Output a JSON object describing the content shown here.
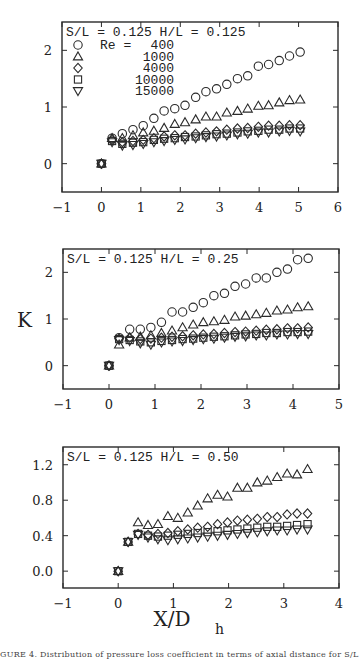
{
  "figure": {
    "y_axis_label": "K",
    "x_axis_label": "X/D",
    "x_axis_label_sub": "h",
    "caption": "GURE 4.  Distribution of pressure loss coefficient in terms of axial distance for S/L = 0"
  },
  "legend": {
    "title_prefix": "Re =",
    "entries": [
      {
        "label": "400",
        "marker": "circle"
      },
      {
        "label": "1000",
        "marker": "triangle-up"
      },
      {
        "label": "4000",
        "marker": "diamond"
      },
      {
        "label": "10000",
        "marker": "square"
      },
      {
        "label": "15000",
        "marker": "triangle-down"
      }
    ]
  },
  "chart_data": [
    {
      "type": "scatter",
      "title": "S/L = 0.125  H/L = 0.125",
      "xlabel": "",
      "ylabel": "",
      "xlim": [
        -1,
        6
      ],
      "ylim": [
        -0.5,
        2.5
      ],
      "xticks": [
        -1,
        0,
        1,
        2,
        3,
        4,
        5,
        6
      ],
      "yticks": [
        0,
        1,
        2
      ],
      "ytick_labels": [
        "0",
        "1",
        "2"
      ],
      "grid": false,
      "legend_position": "upper left",
      "box": {
        "left": 62,
        "top": 22,
        "right": 338,
        "bottom": 192
      },
      "origin_point": [
        0,
        0
      ],
      "x": [
        0.27,
        0.53,
        0.8,
        1.06,
        1.33,
        1.59,
        1.86,
        2.12,
        2.39,
        2.65,
        2.92,
        3.18,
        3.45,
        3.71,
        3.98,
        4.24,
        4.51,
        4.77,
        5.04
      ],
      "series": [
        {
          "name": "Re = 400",
          "marker": "circle",
          "values": [
            0.45,
            0.53,
            0.6,
            0.67,
            0.8,
            0.93,
            0.97,
            1.03,
            1.17,
            1.27,
            1.32,
            1.4,
            1.5,
            1.55,
            1.72,
            1.75,
            1.82,
            1.9,
            1.97
          ]
        },
        {
          "name": "Re = 1000",
          "marker": "triangle-up",
          "values": [
            0.45,
            0.45,
            0.5,
            0.55,
            0.58,
            0.63,
            0.7,
            0.73,
            0.78,
            0.83,
            0.83,
            0.9,
            0.93,
            0.97,
            1.02,
            1.03,
            1.08,
            1.12,
            1.13
          ]
        },
        {
          "name": "Re = 4000",
          "marker": "diamond",
          "values": [
            0.42,
            0.38,
            0.4,
            0.42,
            0.45,
            0.48,
            0.5,
            0.5,
            0.53,
            0.55,
            0.57,
            0.6,
            0.62,
            0.63,
            0.65,
            0.67,
            0.67,
            0.68,
            0.68
          ]
        },
        {
          "name": "Re = 10000",
          "marker": "square",
          "values": [
            0.4,
            0.35,
            0.37,
            0.38,
            0.42,
            0.44,
            0.45,
            0.47,
            0.48,
            0.5,
            0.52,
            0.53,
            0.55,
            0.57,
            0.58,
            0.6,
            0.6,
            0.62,
            0.62
          ]
        },
        {
          "name": "Re = 15000",
          "marker": "triangle-down",
          "values": [
            0.38,
            0.32,
            0.33,
            0.35,
            0.38,
            0.4,
            0.42,
            0.43,
            0.45,
            0.47,
            0.48,
            0.5,
            0.52,
            0.53,
            0.55,
            0.55,
            0.57,
            0.58,
            0.57
          ]
        }
      ]
    },
    {
      "type": "scatter",
      "title": "S/L = 0.125  H/L = 0.25",
      "xlabel": "",
      "ylabel": "K",
      "xlim": [
        -1,
        5
      ],
      "ylim": [
        -0.5,
        2.5
      ],
      "xticks": [
        -1,
        0,
        1,
        2,
        3,
        4,
        5
      ],
      "yticks": [
        0,
        1,
        2
      ],
      "ytick_labels": [
        "0",
        "1",
        "2"
      ],
      "grid": false,
      "box": {
        "left": 63,
        "top": 249,
        "right": 339,
        "bottom": 389
      },
      "origin_point": [
        0,
        0
      ],
      "x": [
        0.22,
        0.45,
        0.68,
        0.91,
        1.14,
        1.37,
        1.6,
        1.83,
        2.05,
        2.28,
        2.51,
        2.74,
        2.97,
        3.2,
        3.42,
        3.65,
        3.88,
        4.1,
        4.33
      ],
      "series": [
        {
          "name": "Re = 400",
          "marker": "circle",
          "values": [
            0.6,
            0.78,
            0.78,
            0.82,
            0.93,
            1.15,
            1.15,
            1.25,
            1.35,
            1.5,
            1.55,
            1.7,
            1.75,
            1.88,
            1.88,
            2.0,
            2.07,
            2.27,
            2.3
          ]
        },
        {
          "name": "Re = 1000",
          "marker": "triangle-up",
          "values": [
            0.45,
            0.6,
            0.62,
            0.65,
            0.7,
            0.75,
            0.82,
            0.88,
            0.93,
            0.95,
            0.98,
            1.05,
            1.07,
            1.1,
            1.13,
            1.18,
            1.2,
            1.25,
            1.27
          ]
        },
        {
          "name": "Re = 4000",
          "marker": "diamond",
          "values": [
            0.58,
            0.6,
            0.57,
            0.58,
            0.6,
            0.62,
            0.63,
            0.65,
            0.67,
            0.68,
            0.7,
            0.72,
            0.73,
            0.75,
            0.77,
            0.78,
            0.8,
            0.8,
            0.82
          ]
        },
        {
          "name": "Re = 10000",
          "marker": "square",
          "values": [
            0.57,
            0.55,
            0.52,
            0.5,
            0.53,
            0.55,
            0.57,
            0.58,
            0.6,
            0.62,
            0.63,
            0.65,
            0.67,
            0.68,
            0.7,
            0.7,
            0.72,
            0.72,
            0.73
          ]
        },
        {
          "name": "Re = 15000",
          "marker": "triangle-down",
          "values": [
            0.55,
            0.53,
            0.48,
            0.45,
            0.5,
            0.52,
            0.53,
            0.55,
            0.57,
            0.58,
            0.6,
            0.62,
            0.63,
            0.65,
            0.65,
            0.67,
            0.67,
            0.68,
            0.68
          ]
        }
      ]
    },
    {
      "type": "scatter",
      "title": "S/L = 0.125  H/L = 0.50",
      "xlabel": "X/D_h",
      "ylabel": "",
      "xlim": [
        -1,
        4
      ],
      "ylim": [
        -0.19,
        1.4
      ],
      "xticks": [
        -1,
        0,
        1,
        2,
        3,
        4
      ],
      "yticks": [
        0.0,
        0.4,
        0.8,
        1.2
      ],
      "ytick_labels": [
        "0.0",
        "0.4",
        "0.8",
        "1.2"
      ],
      "grid": false,
      "box": {
        "left": 63,
        "top": 447,
        "right": 339,
        "bottom": 588
      },
      "origin_point": [
        0,
        0
      ],
      "x": [
        0.18,
        0.36,
        0.54,
        0.72,
        0.9,
        1.08,
        1.26,
        1.44,
        1.62,
        1.8,
        1.98,
        2.16,
        2.34,
        2.52,
        2.7,
        2.88,
        3.06,
        3.24,
        3.43
      ],
      "series": [
        {
          "name": "Re = 1000",
          "marker": "triangle-up",
          "values": [
            0.33,
            0.55,
            0.52,
            0.53,
            0.62,
            0.6,
            0.66,
            0.74,
            0.82,
            0.86,
            0.84,
            0.94,
            0.94,
            1.0,
            1.02,
            1.06,
            1.1,
            1.09,
            1.15
          ]
        },
        {
          "name": "Re = 4000",
          "marker": "diamond",
          "values": [
            0.33,
            0.42,
            0.41,
            0.42,
            0.43,
            0.45,
            0.47,
            0.49,
            0.5,
            0.53,
            0.55,
            0.57,
            0.58,
            0.59,
            0.61,
            0.61,
            0.64,
            0.65,
            0.65
          ]
        },
        {
          "name": "Re = 10000",
          "marker": "square",
          "values": [
            0.33,
            0.42,
            0.4,
            0.39,
            0.4,
            0.41,
            0.42,
            0.43,
            0.44,
            0.45,
            0.46,
            0.47,
            0.48,
            0.49,
            0.5,
            0.5,
            0.51,
            0.52,
            0.53
          ]
        },
        {
          "name": "Re = 15000",
          "marker": "triangle-down",
          "values": [
            0.33,
            0.41,
            0.38,
            0.36,
            0.35,
            0.36,
            0.37,
            0.38,
            0.39,
            0.4,
            0.41,
            0.42,
            0.43,
            0.44,
            0.45,
            0.46,
            0.46,
            0.47,
            0.47
          ]
        }
      ]
    }
  ]
}
